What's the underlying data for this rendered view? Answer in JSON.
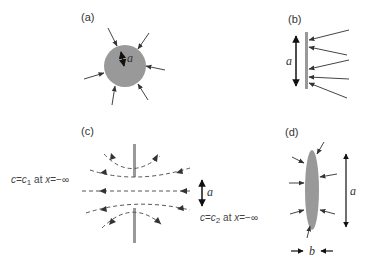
{
  "figure": {
    "panels": [
      {
        "id": "a",
        "label": "(a)",
        "shape": "sphere",
        "dimension_label": "a"
      },
      {
        "id": "b",
        "label": "(b)",
        "shape": "flat plate (edge view)",
        "dimension_label": "a"
      },
      {
        "id": "c",
        "label": "(c)",
        "shape": "slit / aperture with flow lines",
        "dimension_label": "a",
        "left_condition": {
          "c": "c",
          "eq": "=",
          "var": "c",
          "sub": "1",
          "at": " at ",
          "x": "x",
          "eq2": "=",
          "val": "−∞"
        },
        "right_condition": {
          "c": "c",
          "eq": "=",
          "var": "c",
          "sub": "2",
          "at": " at ",
          "x": "x",
          "eq2": "=",
          "val": "−∞"
        }
      },
      {
        "id": "d",
        "label": "(d)",
        "shape": "thin ellipsoid",
        "dimension_label": "a",
        "thickness_label": "b"
      }
    ],
    "colors": {
      "body_fill": "#999999",
      "arrow": "#444444",
      "line": "#555555",
      "dim_arrow": "#111111"
    }
  }
}
